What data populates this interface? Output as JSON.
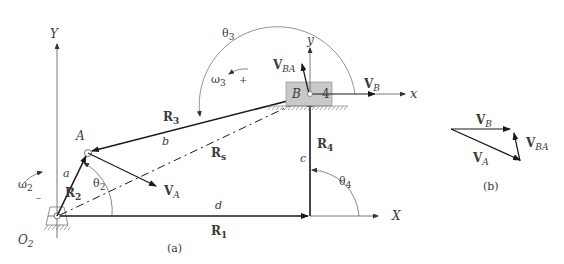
{
  "figure": {
    "part_a_caption": "(a)",
    "part_b_caption": "(b)",
    "colors": {
      "link": "#1a1a1a",
      "axis": "#444444",
      "slider_fill": "#c8c8c8",
      "text": "#3a3a3a"
    }
  },
  "axes": {
    "global_x": "X",
    "global_y": "Y",
    "local_x": "x",
    "local_y": "y"
  },
  "points": {
    "ground_pivot": {
      "label": "O",
      "sub": "2"
    },
    "A": {
      "label": "A"
    },
    "B": {
      "label": "B"
    },
    "slider": {
      "label": "4"
    }
  },
  "links": {
    "a": "a",
    "b": "b",
    "c": "c",
    "d": "d"
  },
  "vectors": {
    "R1": {
      "label": "R",
      "sub": "1"
    },
    "R2": {
      "label": "R",
      "sub": "2"
    },
    "R3": {
      "label": "R",
      "sub": "3"
    },
    "R4": {
      "label": "R",
      "sub": "4"
    },
    "Rs": {
      "label": "R",
      "sub": "s"
    }
  },
  "angles": {
    "theta2": {
      "label": "θ",
      "sub": "2"
    },
    "theta3": {
      "label": "θ",
      "sub": "3"
    },
    "theta4": {
      "label": "θ",
      "sub": "4"
    }
  },
  "angular_velocities": {
    "omega2": {
      "label": "ω",
      "sub": "2",
      "sign": "–"
    },
    "omega3": {
      "label": "ω",
      "sub": "3",
      "sign": "+"
    }
  },
  "velocities": {
    "VA": {
      "label": "V",
      "sub": "A"
    },
    "VB": {
      "label": "V",
      "sub": "B"
    },
    "VBA": {
      "label": "V",
      "sub": "BA"
    }
  },
  "polygon_b": {
    "VB": {
      "label": "V",
      "sub": "B"
    },
    "VA": {
      "label": "V",
      "sub": "A"
    },
    "VBA": {
      "label": "V",
      "sub": "BA"
    }
  }
}
